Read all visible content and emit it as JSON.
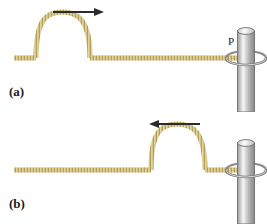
{
  "figure": {
    "width": 267,
    "height": 224,
    "background_color": "#ffffff"
  },
  "colors": {
    "rope_fill": "#d8c98a",
    "rope_stroke": "#b39a4d",
    "rope_hatch": "#a88f3f",
    "rope_highlight": "#efe6c2",
    "pole_light": "#f2f2f2",
    "pole_mid": "#b9b9b9",
    "pole_dark": "#8f8f8f",
    "pole_stroke": "#6e6e6e",
    "ring_stroke": "#7a7a7a",
    "ring_fill": "#d5d5d5",
    "arrow_color": "#2b2b2b",
    "label_color": "#1a1a1a"
  },
  "panels": [
    {
      "id": "a",
      "label": "(a)",
      "caption_text": "(a)",
      "point_label": "P",
      "arrow": {
        "direction": "right",
        "icon": "arrow-right-icon",
        "x_start": 53,
        "x_end": 100,
        "y": 12
      },
      "pulse": {
        "shape": "hump-up",
        "peak_x": 62,
        "peak_y": 19,
        "base_left_x": 36,
        "base_right_x": 90,
        "amplitude": 39,
        "position_description": "near left end, travelling toward the pole"
      },
      "rope": {
        "baseline_y": 58,
        "x_start": 14,
        "x_end": 243
      },
      "pole": {
        "x_center": 246,
        "top_y": 27,
        "bottom_y": 112,
        "width": 17
      },
      "ring": {
        "x_center": 246,
        "y_center": 58,
        "rx": 20,
        "ry": 7
      }
    },
    {
      "id": "b",
      "label": "(b)",
      "caption_text": "(b)",
      "point_label": "P",
      "arrow": {
        "direction": "left",
        "icon": "arrow-left-icon",
        "x_start": 200,
        "x_end": 153,
        "y": 12
      },
      "pulse": {
        "shape": "hump-up",
        "peak_x": 177,
        "peak_y": 19,
        "base_left_x": 151,
        "base_right_x": 205,
        "amplitude": 39,
        "position_description": "near the pole, travelling away from the pole"
      },
      "rope": {
        "baseline_y": 58,
        "x_start": 14,
        "x_end": 243
      },
      "pole": {
        "x_center": 246,
        "top_y": 27,
        "bottom_y": 112,
        "width": 17
      },
      "ring": {
        "x_center": 246,
        "y_center": 58,
        "rx": 20,
        "ry": 7
      }
    }
  ]
}
